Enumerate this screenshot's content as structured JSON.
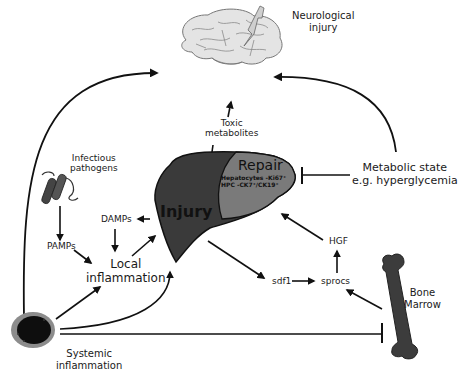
{
  "figure": {
    "colors": {
      "background": "#ffffff",
      "line": "#111111",
      "liver_injury": "#3a3a3a",
      "liver_repair": "#7a7a7a",
      "brain": "#e4e4e4",
      "bone": "#3c3c3c",
      "cell_outer": "#8c8c8c",
      "cell_inner": "#0e0e0e"
    }
  },
  "nodes": {
    "neurological_injury": {
      "line1": "Neurological",
      "line2": "injury"
    },
    "toxic_metabolites": {
      "line1": "Toxic",
      "line2": "metabolites"
    },
    "metabolic_state": {
      "line1": "Metabolic state",
      "line2": "e.g. hyperglycemia"
    },
    "infectious_pathogens": {
      "line1": "Infectious",
      "line2": "pathogens"
    },
    "damps": {
      "label": "DAMPs"
    },
    "pamps": {
      "label": "PAMPs"
    },
    "local_inflammation": {
      "line1": "Local",
      "line2": "inflammation"
    },
    "liver_injury": {
      "label": "Injury"
    },
    "liver_repair": {
      "label": "Repair",
      "line1": "Hepatocytes -Ki67⁺",
      "line2": "HPC -CK7⁺/CK19⁺"
    },
    "hgf": {
      "label": "HGF"
    },
    "sdf1": {
      "label": "sdf1"
    },
    "sprocs": {
      "label": "sprocs"
    },
    "bone_marrow": {
      "line1": "Bone",
      "line2": "Marrow"
    },
    "systemic_inflammation": {
      "line1": "Systemic",
      "line2": "inflammation"
    }
  },
  "edges": [
    {
      "from": "systemic_inflammation",
      "to": "neurological_injury",
      "type": "activates"
    },
    {
      "from": "metabolic_state",
      "to": "neurological_injury",
      "type": "activates"
    },
    {
      "from": "liver_injury",
      "to": "neurological_injury",
      "via": "toxic_metabolites",
      "type": "activates"
    },
    {
      "from": "metabolic_state",
      "to": "liver_repair",
      "type": "inhibits"
    },
    {
      "from": "infectious_pathogens",
      "to": "pamps",
      "type": "activates"
    },
    {
      "from": "liver_injury",
      "to": "damps",
      "type": "activates"
    },
    {
      "from": "damps",
      "to": "local_inflammation",
      "type": "activates"
    },
    {
      "from": "pamps",
      "to": "local_inflammation",
      "type": "activates"
    },
    {
      "from": "local_inflammation",
      "to": "liver_injury",
      "type": "activates"
    },
    {
      "from": "systemic_inflammation",
      "to": "local_inflammation",
      "type": "activates"
    },
    {
      "from": "systemic_inflammation",
      "to": "liver_injury",
      "type": "activates"
    },
    {
      "from": "systemic_inflammation",
      "to": "bone_marrow",
      "type": "inhibits"
    },
    {
      "from": "liver_injury",
      "to": "sdf1",
      "type": "activates"
    },
    {
      "from": "sdf1",
      "to": "sprocs",
      "type": "activates"
    },
    {
      "from": "bone_marrow",
      "to": "sprocs",
      "type": "activates"
    },
    {
      "from": "sprocs",
      "to": "hgf",
      "type": "activates"
    },
    {
      "from": "hgf",
      "to": "liver_repair",
      "type": "activates"
    }
  ]
}
